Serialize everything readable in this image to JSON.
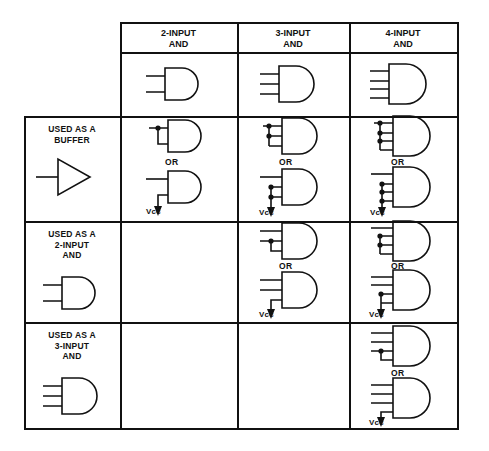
{
  "figure": {
    "type": "table-diagram",
    "corner_cell": ""
  },
  "columns": [
    {
      "id": "col-2input-and",
      "label": "2-INPUT\nAND",
      "inputs": 2
    },
    {
      "id": "col-3input-and",
      "label": "3-INPUT\nAND",
      "inputs": 3
    },
    {
      "id": "col-4input-and",
      "label": "4-INPUT\nAND",
      "inputs": 4
    }
  ],
  "rows": [
    {
      "id": "row-symbol",
      "label": "",
      "symbol": "none",
      "cells": [
        {
          "column": "col-2input-and",
          "empty": false,
          "options": [
            {
              "gate_inputs": 2,
              "style": "plain"
            }
          ]
        },
        {
          "column": "col-3input-and",
          "empty": false,
          "options": [
            {
              "gate_inputs": 3,
              "style": "plain"
            }
          ]
        },
        {
          "column": "col-4input-and",
          "empty": false,
          "options": [
            {
              "gate_inputs": 4,
              "style": "plain"
            }
          ]
        }
      ]
    },
    {
      "id": "row-buffer",
      "label": "USED AS A\nBUFFER",
      "symbol": "buffer",
      "cells": [
        {
          "column": "col-2input-and",
          "empty": false,
          "or_label": "OR",
          "vcc_label": "Vcc",
          "options": [
            {
              "gate_inputs": 2,
              "style": "tied",
              "tied_inputs": 2,
              "signal_inputs": 1
            },
            {
              "gate_inputs": 2,
              "style": "vcc",
              "vcc_inputs": 1,
              "signal_inputs": 1
            }
          ]
        },
        {
          "column": "col-3input-and",
          "empty": false,
          "or_label": "OR",
          "vcc_label": "Vcc",
          "options": [
            {
              "gate_inputs": 3,
              "style": "tied",
              "tied_inputs": 3,
              "signal_inputs": 1
            },
            {
              "gate_inputs": 3,
              "style": "vcc",
              "vcc_inputs": 2,
              "signal_inputs": 1
            }
          ]
        },
        {
          "column": "col-4input-and",
          "empty": false,
          "or_label": "OR",
          "vcc_label": "Vcc",
          "options": [
            {
              "gate_inputs": 4,
              "style": "tied",
              "tied_inputs": 4,
              "signal_inputs": 1
            },
            {
              "gate_inputs": 4,
              "style": "vcc",
              "vcc_inputs": 3,
              "signal_inputs": 1
            }
          ]
        }
      ]
    },
    {
      "id": "row-2input-and",
      "label": "USED AS A\n2-INPUT\nAND",
      "symbol": "and2",
      "cells": [
        {
          "column": "col-2input-and",
          "empty": true,
          "options": []
        },
        {
          "column": "col-3input-and",
          "empty": false,
          "or_label": "OR",
          "vcc_label": "Vcc",
          "options": [
            {
              "gate_inputs": 3,
              "style": "tied",
              "tied_inputs": 2,
              "signal_inputs": 2
            },
            {
              "gate_inputs": 3,
              "style": "vcc",
              "vcc_inputs": 1,
              "signal_inputs": 2
            }
          ]
        },
        {
          "column": "col-4input-and",
          "empty": false,
          "or_label": "OR",
          "vcc_label": "Vcc",
          "options": [
            {
              "gate_inputs": 4,
              "style": "tied",
              "tied_inputs": 3,
              "signal_inputs": 2
            },
            {
              "gate_inputs": 4,
              "style": "vcc",
              "vcc_inputs": 2,
              "signal_inputs": 2
            }
          ]
        }
      ]
    },
    {
      "id": "row-3input-and",
      "label": "USED AS A\n3-INPUT\nAND",
      "symbol": "and3",
      "cells": [
        {
          "column": "col-2input-and",
          "empty": true,
          "options": []
        },
        {
          "column": "col-3input-and",
          "empty": true,
          "options": []
        },
        {
          "column": "col-4input-and",
          "empty": false,
          "or_label": "OR",
          "vcc_label": "Vcc",
          "options": [
            {
              "gate_inputs": 4,
              "style": "tied",
              "tied_inputs": 2,
              "signal_inputs": 3
            },
            {
              "gate_inputs": 4,
              "style": "vcc",
              "vcc_inputs": 1,
              "signal_inputs": 3
            }
          ]
        }
      ]
    }
  ],
  "text": {
    "or": "OR",
    "vcc": "Vcc"
  },
  "colors": {
    "ink": "#111111",
    "paper": "#ffffff"
  }
}
